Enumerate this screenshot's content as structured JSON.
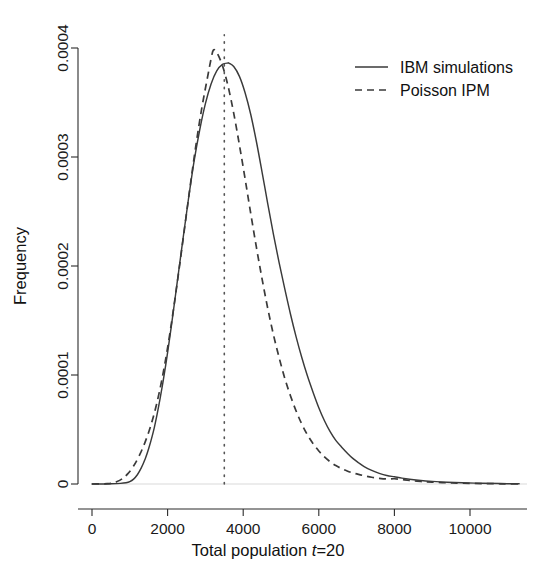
{
  "chart_data": {
    "type": "line",
    "title": "",
    "xlabel": "Total population t=20",
    "xlabel_prefix": "Total population ",
    "xlabel_italic": "t",
    "xlabel_suffix": "=20",
    "ylabel": "Frequency",
    "xlim": [
      -250,
      11500
    ],
    "ylim": [
      0,
      0.00042
    ],
    "xticks": [
      0,
      2000,
      4000,
      6000,
      8000,
      10000
    ],
    "xtick_labels": [
      "0",
      "2000",
      "4000",
      "6000",
      "8000",
      "10000"
    ],
    "yticks": [
      0,
      0.0001,
      0.0002,
      0.0003,
      0.0004
    ],
    "ytick_labels": [
      "0",
      "0.0001",
      "0.0002",
      "0.0003",
      "0.0004"
    ],
    "grid": false,
    "legend_position": "top-right",
    "legend": [
      "IBM simulations",
      "Poisson IPM"
    ],
    "annotations": [
      {
        "name": "vertical-reference-line",
        "style": "dotted",
        "x": 3500,
        "y_from": 0,
        "y_to": 0.000412
      }
    ],
    "series": [
      {
        "name": "IBM simulations",
        "style": "solid",
        "color": "#3a3a3a",
        "x": [
          0,
          250,
          500,
          750,
          900,
          1000,
          1100,
          1200,
          1300,
          1400,
          1500,
          1650,
          1800,
          1950,
          2100,
          2250,
          2400,
          2550,
          2700,
          2850,
          3000,
          3150,
          3300,
          3450,
          3600,
          3630,
          3750,
          3900,
          4050,
          4200,
          4350,
          4500,
          4650,
          4800,
          4950,
          5100,
          5250,
          5400,
          5550,
          5700,
          5850,
          6000,
          6150,
          6300,
          6450,
          6600,
          6750,
          6900,
          7050,
          7200,
          7400,
          7600,
          7800,
          8000,
          8200,
          8400,
          8700,
          9000,
          9400,
          9800,
          10300,
          10800,
          11300
        ],
        "y": [
          0.0,
          0.0,
          2e-07,
          6e-07,
          1.2e-06,
          2.2e-06,
          4.5e-06,
          8.5e-06,
          1.45e-05,
          2.25e-05,
          3.25e-05,
          5.2e-05,
          7.8e-05,
          0.000109,
          0.000145,
          0.000184,
          0.000223,
          0.000261,
          0.000296,
          0.000325,
          0.000349,
          0.000367,
          0.000379,
          0.000385,
          0.0003862,
          0.000386,
          0.000383,
          0.000374,
          0.000359,
          0.000339,
          0.000314,
          0.000286,
          0.000257,
          0.000229,
          0.000203,
          0.000179,
          0.000156,
          0.000135,
          0.000116,
          9.9e-05,
          8.4e-05,
          7e-05,
          5.8e-05,
          4.8e-05,
          4e-05,
          3.4e-05,
          2.85e-05,
          2.35e-05,
          1.95e-05,
          1.6e-05,
          1.25e-05,
          9.8e-06,
          7.8e-06,
          6.6e-06,
          5.4e-06,
          4.4e-06,
          3.2e-06,
          2.4e-06,
          1.6e-06,
          1.1e-06,
          7e-07,
          4e-07,
          2e-07
        ]
      },
      {
        "name": "Poisson IPM",
        "style": "dashed",
        "color": "#3a3a3a",
        "x": [
          0,
          200,
          400,
          530,
          650,
          800,
          950,
          1100,
          1250,
          1400,
          1550,
          1700,
          1850,
          2000,
          2150,
          2300,
          2450,
          2600,
          2750,
          2900,
          3050,
          3150,
          3210,
          3300,
          3450,
          3600,
          3750,
          3900,
          4050,
          4200,
          4350,
          4500,
          4650,
          4800,
          4950,
          5100,
          5250,
          5400,
          5550,
          5700,
          5850,
          6000,
          6150,
          6300,
          6450,
          6600,
          6750,
          6900,
          7050,
          7200,
          7400,
          7600,
          7800,
          8000,
          8200,
          8400,
          8700,
          9000,
          9400,
          9800,
          10300,
          10800,
          11300
        ],
        "y": [
          0.0,
          1e-07,
          3e-07,
          8e-07,
          2e-06,
          4.8e-06,
          9.5e-06,
          1.65e-05,
          2.6e-05,
          3.8e-05,
          5.3e-05,
          7.2e-05,
          9.6e-05,
          0.000125,
          0.000159,
          0.000196,
          0.000235,
          0.000274,
          0.000311,
          0.000344,
          0.000372,
          0.00039,
          0.000398,
          0.000396,
          0.000384,
          0.000365,
          0.00034,
          0.000311,
          0.00028,
          0.000248,
          0.000217,
          0.000188,
          0.000161,
          0.000137,
          0.000116,
          9.7e-05,
          8.1e-05,
          6.7e-05,
          5.5e-05,
          4.5e-05,
          3.7e-05,
          3.03e-05,
          2.48e-05,
          2.04e-05,
          1.69e-05,
          1.42e-05,
          1.2e-05,
          1.02e-05,
          8.8e-06,
          7.6e-06,
          6.2e-06,
          5.2e-06,
          4.6e-06,
          4.8e-06,
          4e-06,
          3.2e-06,
          2.3e-06,
          1.7e-06,
          1.1e-06,
          7e-07,
          4e-07,
          2e-07,
          1e-07
        ]
      }
    ]
  },
  "axes": {
    "y_title": "Frequency",
    "x_title_prefix": "Total population ",
    "x_title_italic": "t",
    "x_title_suffix": "=20"
  },
  "legend": {
    "entries": [
      {
        "label": "IBM simulations",
        "style": "solid"
      },
      {
        "label": "Poisson IPM",
        "style": "dashed"
      }
    ]
  },
  "colors": {
    "curve": "#3a3a3a",
    "axis": "#2b2b2b",
    "text": "#1a1a1a",
    "background": "#ffffff"
  }
}
